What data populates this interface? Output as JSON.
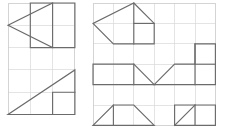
{
  "document": {
    "title": "Geometry Grid Figures",
    "description": "Two square-grid worksheets showing outlined polygons drawn on grid paper",
    "background_color": "#ffffff"
  },
  "style": {
    "grid_line_color": "#d8d8d8",
    "panel_border_color": "#c9c9c9",
    "shape_stroke_color": "#6b6b6b",
    "shape_stroke_width": 1.15,
    "grid_line_width": 0.7
  },
  "panels": [
    {
      "name": "left-panel",
      "label": "Left worksheet",
      "x": 8,
      "y": 3,
      "cell": 22.3,
      "cols": 3,
      "rows": 5,
      "shapes": [
        {
          "name": "left-pointing-dart",
          "label": "Left pointing arrow / dart",
          "closed": true,
          "points": [
            [
              2,
              0
            ],
            [
              2,
              2
            ],
            [
              0,
              1
            ]
          ]
        },
        {
          "name": "dart-square-body",
          "label": "Square body of the dart",
          "closed": true,
          "points": [
            [
              1,
              0
            ],
            [
              3,
              0
            ],
            [
              3,
              2
            ],
            [
              1,
              2
            ]
          ]
        },
        {
          "name": "lower-right-triangle",
          "label": "Right triangle lower half",
          "closed": true,
          "points": [
            [
              0,
              5
            ],
            [
              3,
              5
            ],
            [
              3,
              3
            ]
          ]
        },
        {
          "name": "lower-triangle-inner-square",
          "label": "Inner square of lower triangle",
          "closed": false,
          "points": [
            [
              2,
              5
            ],
            [
              2,
              4
            ],
            [
              3,
              4
            ]
          ]
        }
      ]
    },
    {
      "name": "right-panel",
      "label": "Right worksheet",
      "x": 93,
      "y": 3,
      "cell": 20.4,
      "cols": 6,
      "rows": 6,
      "shapes": [
        {
          "name": "pentagon-house-top",
          "label": "Pentagon house shape top centre",
          "closed": true,
          "points": [
            [
              2,
              0
            ],
            [
              3,
              1
            ],
            [
              3,
              2
            ],
            [
              1,
              2
            ],
            [
              0,
              1
            ]
          ]
        },
        {
          "name": "pentagon-inner-square",
          "label": "Inner square of the pentagon",
          "closed": false,
          "points": [
            [
              2,
              0
            ],
            [
              2,
              2
            ]
          ]
        },
        {
          "name": "pentagon-inner-edge",
          "label": "Inner edge of the pentagon",
          "closed": false,
          "points": [
            [
              2,
              1
            ],
            [
              3,
              1
            ]
          ]
        },
        {
          "name": "right-arrow-shape",
          "label": "Arrow shape pointing left on middle right",
          "closed": true,
          "points": [
            [
              6,
              2
            ],
            [
              6,
              4
            ],
            [
              3,
              4
            ],
            [
              4,
              3
            ],
            [
              5,
              3
            ],
            [
              5,
              2
            ]
          ]
        },
        {
          "name": "right-arrow-inner-top",
          "label": "Inner edge top of right arrow",
          "closed": false,
          "points": [
            [
              5,
              2
            ],
            [
              5,
              4
            ]
          ]
        },
        {
          "name": "right-arrow-inner-edge",
          "label": "Inner edge of right arrow",
          "closed": false,
          "points": [
            [
              5,
              3
            ],
            [
              6,
              3
            ]
          ]
        },
        {
          "name": "middle-left-trapezoid",
          "label": "Trapezoid middle left",
          "closed": true,
          "points": [
            [
              0,
              3
            ],
            [
              2,
              3
            ],
            [
              3,
              4
            ],
            [
              0,
              4
            ]
          ]
        },
        {
          "name": "middle-left-inner-line",
          "label": "Inner vertical line of middle left trapezoid",
          "closed": false,
          "points": [
            [
              2,
              3
            ],
            [
              2,
              4
            ]
          ]
        },
        {
          "name": "bottom-left-trapezoid",
          "label": "Trapezoid bottom left",
          "closed": true,
          "points": [
            [
              0,
              6
            ],
            [
              1,
              5
            ],
            [
              2,
              5
            ],
            [
              3,
              6
            ]
          ]
        },
        {
          "name": "bottom-left-inner-line",
          "label": "Inner vertical line of bottom left trapezoid",
          "closed": false,
          "points": [
            [
              1,
              5
            ],
            [
              1,
              6
            ]
          ]
        },
        {
          "name": "bottom-right-rectangle",
          "label": "Rectangle with diagonal bottom right",
          "closed": true,
          "points": [
            [
              4,
              5
            ],
            [
              6,
              5
            ],
            [
              6,
              6
            ],
            [
              4,
              6
            ]
          ]
        },
        {
          "name": "bottom-right-diagonal",
          "label": "Diagonal inside bottom right rectangle",
          "closed": false,
          "points": [
            [
              4,
              6
            ],
            [
              5,
              5
            ]
          ]
        },
        {
          "name": "bottom-right-inner-line",
          "label": "Inner vertical line of bottom right rectangle",
          "closed": false,
          "points": [
            [
              5,
              5
            ],
            [
              5,
              6
            ]
          ]
        }
      ]
    }
  ]
}
